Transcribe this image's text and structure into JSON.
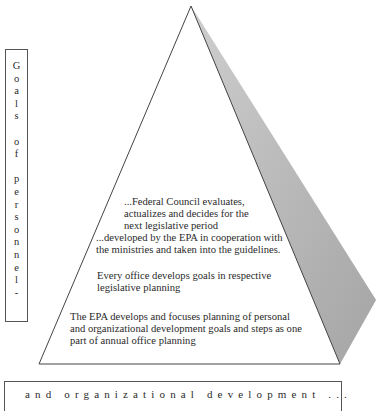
{
  "diagram": {
    "type": "pyramid",
    "colors": {
      "outline": "#444444",
      "shaded_face": "#b4b4b4",
      "text": "#2a2a2a",
      "background": "#ffffff"
    },
    "side_label": {
      "text": "Goals of personnel-",
      "letters": [
        "G",
        "o",
        "a",
        "l",
        "s",
        "",
        "o",
        "f",
        "",
        "p",
        "e",
        "r",
        "s",
        "o",
        "n",
        "n",
        "e",
        "l",
        "-"
      ]
    },
    "bottom_label": {
      "text": "and organizational development ..."
    },
    "levels": [
      {
        "lines": [
          "...Federal Council evaluates,",
          "actualizes and decides for the",
          "next legislative period"
        ]
      },
      {
        "lines": [
          "...developed by the EPA in cooperation with",
          "the ministries and taken into the guidelines."
        ]
      },
      {
        "lines": [
          "Every office develops goals in respective",
          "legislative planning"
        ]
      },
      {
        "lines": [
          "The EPA develops and focuses planning of personal",
          "and organizational development goals and steps as one",
          "part of annual office planning"
        ]
      }
    ]
  }
}
